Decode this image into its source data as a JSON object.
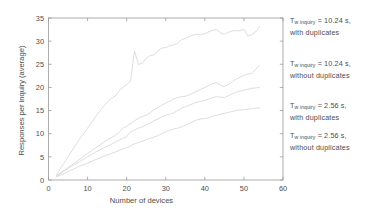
{
  "chart_data": {
    "type": "line",
    "title": "",
    "xlabel": "Number of devices",
    "ylabel": "Responses per inquiry (average)",
    "xlim": [
      0,
      60
    ],
    "ylim": [
      0,
      35
    ],
    "xticks": [
      0,
      10,
      20,
      30,
      40,
      50,
      60
    ],
    "yticks": [
      0,
      5,
      10,
      15,
      20,
      25,
      30,
      35
    ],
    "grid": false,
    "legend_position": "right-outside",
    "line_color": "#d9d9d9",
    "axis_color": "#9a9a9a",
    "series": [
      {
        "name": "Tw inquiry = 10.24 s, with duplicates",
        "x": [
          2,
          3,
          4,
          5,
          6,
          7,
          8,
          9,
          10,
          11,
          12,
          13,
          14,
          15,
          16,
          17,
          18,
          19,
          20,
          21,
          22,
          23,
          24,
          25,
          26,
          27,
          28,
          29,
          30,
          31,
          32,
          33,
          34,
          35,
          36,
          37,
          38,
          39,
          40,
          41,
          42,
          43,
          44,
          45,
          46,
          47,
          48,
          49,
          50,
          51,
          52,
          53,
          54
        ],
        "values": [
          1.0,
          2.4,
          3.7,
          5.0,
          6.3,
          7.6,
          8.9,
          10.0,
          11.2,
          12.4,
          13.6,
          14.7,
          15.9,
          16.8,
          17.6,
          18.1,
          19.2,
          20.0,
          20.6,
          21.4,
          27.9,
          25.0,
          25.2,
          26.3,
          26.9,
          27.0,
          28.0,
          28.5,
          28.6,
          29.0,
          29.2,
          29.5,
          30.3,
          30.6,
          31.0,
          31.3,
          31.5,
          31.4,
          31.6,
          32.0,
          32.4,
          32.5,
          31.8,
          31.5,
          31.9,
          32.2,
          32.3,
          32.2,
          32.6,
          31.1,
          31.4,
          32.0,
          33.2
        ],
        "endpoint": 33.2
      },
      {
        "name": "Tw inquiry = 10.24 s, without duplicates",
        "x": [
          2,
          3,
          4,
          5,
          6,
          7,
          8,
          9,
          10,
          11,
          12,
          13,
          14,
          15,
          16,
          17,
          18,
          19,
          20,
          21,
          22,
          23,
          24,
          25,
          26,
          27,
          28,
          29,
          30,
          31,
          32,
          33,
          34,
          35,
          36,
          37,
          38,
          39,
          40,
          41,
          42,
          43,
          44,
          45,
          46,
          47,
          48,
          49,
          50,
          51,
          52,
          53,
          54
        ],
        "values": [
          0.9,
          1.5,
          2.1,
          2.7,
          3.3,
          3.9,
          4.5,
          5.1,
          5.7,
          6.3,
          6.9,
          7.5,
          8.1,
          8.6,
          9.1,
          9.6,
          10.2,
          11.2,
          11.6,
          12.2,
          12.8,
          13.3,
          13.7,
          14.0,
          14.5,
          15.2,
          15.6,
          16.2,
          16.6,
          17.0,
          17.5,
          17.8,
          18.0,
          18.1,
          18.4,
          18.8,
          19.2,
          19.6,
          20.0,
          20.4,
          20.8,
          21.0,
          20.5,
          20.2,
          20.6,
          21.2,
          21.8,
          22.2,
          22.6,
          22.9,
          23.0,
          23.9,
          24.8
        ],
        "endpoint": 24.8
      },
      {
        "name": "Tw inquiry = 2.56 s, with duplicates",
        "x": [
          2,
          3,
          4,
          5,
          6,
          7,
          8,
          9,
          10,
          11,
          12,
          13,
          14,
          15,
          16,
          17,
          18,
          19,
          20,
          21,
          22,
          23,
          24,
          25,
          26,
          27,
          28,
          29,
          30,
          31,
          32,
          33,
          34,
          35,
          36,
          37,
          38,
          39,
          40,
          41,
          42,
          43,
          44,
          45,
          46,
          47,
          48,
          49,
          50,
          51,
          52,
          53,
          54
        ],
        "values": [
          0.8,
          1.3,
          1.9,
          2.5,
          3.0,
          3.5,
          4.0,
          4.5,
          5.0,
          5.5,
          6.0,
          6.4,
          6.9,
          7.3,
          7.7,
          8.1,
          8.6,
          9.0,
          9.4,
          10.4,
          10.8,
          11.2,
          11.5,
          11.9,
          12.3,
          12.8,
          13.2,
          13.6,
          14.0,
          14.2,
          14.5,
          15.0,
          15.5,
          15.8,
          16.2,
          16.5,
          16.8,
          17.0,
          17.2,
          17.4,
          17.8,
          18.0,
          17.9,
          17.8,
          18.2,
          18.6,
          19.0,
          19.2,
          19.4,
          19.6,
          19.8,
          19.9,
          20.0
        ],
        "endpoint": 20.0
      },
      {
        "name": "Tw inquiry = 2.56 s, without duplicates",
        "x": [
          2,
          3,
          4,
          5,
          6,
          7,
          8,
          9,
          10,
          11,
          12,
          13,
          14,
          15,
          16,
          17,
          18,
          19,
          20,
          21,
          22,
          23,
          24,
          25,
          26,
          27,
          28,
          29,
          30,
          31,
          32,
          33,
          34,
          35,
          36,
          37,
          38,
          39,
          40,
          41,
          42,
          43,
          44,
          45,
          46,
          47,
          48,
          49,
          50,
          51,
          52,
          53,
          54
        ],
        "values": [
          0.7,
          1.0,
          1.4,
          1.8,
          2.2,
          2.6,
          3.0,
          3.3,
          3.7,
          4.0,
          4.4,
          4.7,
          5.1,
          5.4,
          5.7,
          6.0,
          6.4,
          6.7,
          7.0,
          7.4,
          7.8,
          8.1,
          8.4,
          8.7,
          9.0,
          9.3,
          9.6,
          10.0,
          10.4,
          10.7,
          11.0,
          11.2,
          11.5,
          11.8,
          12.2,
          12.6,
          13.0,
          13.2,
          13.3,
          13.4,
          13.8,
          14.0,
          14.2,
          14.4,
          14.6,
          14.8,
          15.0,
          15.1,
          15.2,
          15.3,
          15.4,
          15.5,
          15.6
        ],
        "endpoint": 15.6
      }
    ]
  },
  "axes": {
    "xlabel": "Number of devices",
    "ylabel": "Responses per inquiry (average)",
    "xtick_labels": [
      "0",
      "10",
      "20",
      "30",
      "40",
      "50",
      "60"
    ],
    "ytick_labels": [
      "0",
      "5",
      "10",
      "15",
      "20",
      "25",
      "30",
      "35"
    ]
  },
  "legend": {
    "entries": [
      {
        "symbol": "T",
        "subscript": "w  inquiry",
        "line1_tail": " = 10.24 s,",
        "line2": "with duplicates"
      },
      {
        "symbol": "T",
        "subscript": "w  inquiry",
        "line1_tail": " = 10.24 s,",
        "line2": "without duplicates"
      },
      {
        "symbol": "T",
        "subscript": "w  inquiry",
        "line1_tail": " = 2.56 s,",
        "line2": "with duplicates"
      },
      {
        "symbol": "T",
        "subscript": "w  inquiry",
        "line1_tail": " = 2.56 s,",
        "line2": "without duplicates"
      }
    ]
  }
}
